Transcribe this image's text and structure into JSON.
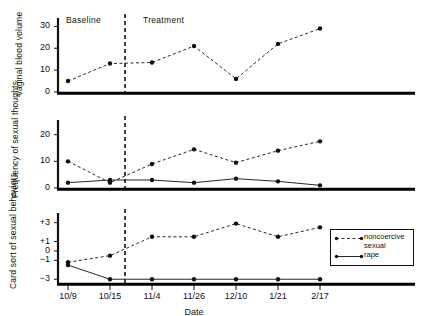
{
  "chart_data": {
    "type": "line",
    "title": "",
    "xlabel": "Date",
    "categories": [
      "10/9",
      "10/15",
      "11/4",
      "11/26",
      "12/10",
      "1/21",
      "2/17"
    ],
    "grid": false,
    "legend_position": "inside-bottom-right",
    "phase_change": {
      "labels": [
        "Baseline",
        "Treatment"
      ],
      "between": [
        "10/15",
        "11/4"
      ],
      "style": "vertical-dashed-line"
    },
    "panels": [
      {
        "ylabel": "Vaginal blood volume",
        "ylim": [
          0,
          32
        ],
        "yticks": [
          0,
          10,
          20,
          30
        ],
        "ytick_labels": [
          "0",
          "10",
          "20",
          "30"
        ],
        "series": [
          {
            "name": "noncoercive sexual",
            "style": "dashed",
            "marker": "filled-circle",
            "values": [
              5,
              13,
              13.5,
              21,
              6,
              22,
              29
            ]
          }
        ]
      },
      {
        "ylabel": "Frequency of sexual thoughts",
        "ylim": [
          0,
          24
        ],
        "yticks": [
          0,
          10,
          20
        ],
        "ytick_labels": [
          "0",
          "10",
          "20"
        ],
        "series": [
          {
            "name": "noncoercive sexual",
            "style": "dashed",
            "marker": "filled-circle",
            "values": [
              10,
              2,
              9,
              14.5,
              9.5,
              14,
              17.5
            ]
          },
          {
            "name": "rape",
            "style": "solid",
            "marker": "filled-circle",
            "values": [
              2,
              3,
              3,
              2,
              3.5,
              2.5,
              1
            ]
          }
        ]
      },
      {
        "ylabel": "Card sort of sexual behaviors",
        "ylim": [
          -3.4,
          3.6
        ],
        "yticks": [
          3,
          1,
          0,
          -1,
          -3
        ],
        "ytick_labels": [
          "+3",
          "+1",
          "0",
          "−1",
          "−3"
        ],
        "series": [
          {
            "name": "noncoercive sexual",
            "style": "dashed",
            "marker": "filled-circle",
            "values": [
              -1.2,
              -0.5,
              1.5,
              1.5,
              2.9,
              1.5,
              2.5
            ]
          },
          {
            "name": "rape",
            "style": "solid",
            "marker": "filled-circle",
            "values": [
              -1.5,
              -3,
              -3,
              -3,
              -3,
              -3,
              -3
            ]
          }
        ]
      }
    ],
    "legend": [
      {
        "label": "noncoercive\nsexual",
        "style": "dashed"
      },
      {
        "label": "rape",
        "style": "solid"
      }
    ]
  }
}
